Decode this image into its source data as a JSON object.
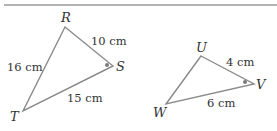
{
  "colors": {
    "rule": "#9a9a9a",
    "edge": "#8a8a8a",
    "text": "#333333",
    "angle_dot": "#7a7a7a"
  },
  "triangle_rst": {
    "vertices": {
      "R": {
        "label": "R",
        "x": 65,
        "y": 27
      },
      "S": {
        "label": "S",
        "x": 113,
        "y": 66
      },
      "T": {
        "label": "T",
        "x": 23,
        "y": 111
      }
    },
    "sides": {
      "RS": "10 cm",
      "RT": "16 cm",
      "ST": "15 cm"
    },
    "marked_angle": "S"
  },
  "triangle_uvw": {
    "vertices": {
      "U": {
        "label": "U",
        "x": 201,
        "y": 56
      },
      "V": {
        "label": "V",
        "x": 254,
        "y": 84
      },
      "W": {
        "label": "W",
        "x": 166,
        "y": 104
      }
    },
    "sides": {
      "UV": "4 cm",
      "VW": "6 cm"
    },
    "marked_angle": "V"
  }
}
